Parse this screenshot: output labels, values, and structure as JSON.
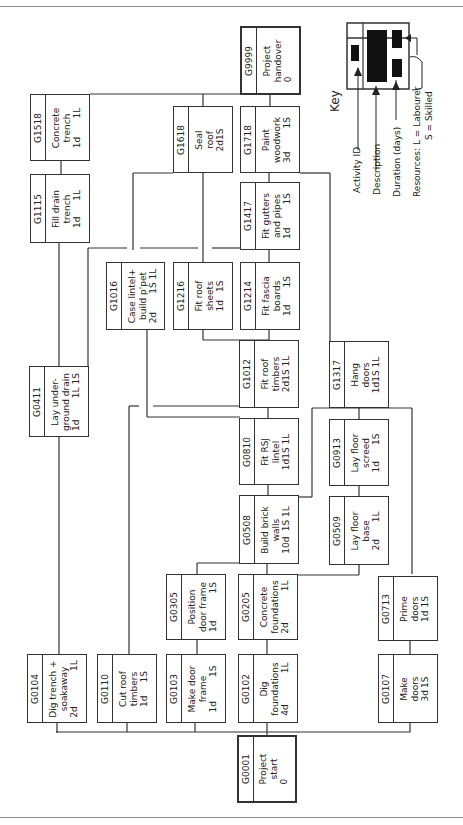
{
  "key": {
    "title": "Key",
    "labels": {
      "activity_id": "Activity ID",
      "description": "Description",
      "duration": "Duration (days)",
      "resources_label": "Resources:",
      "labourer": "L = Labourer",
      "skilled": "S = Skilled"
    }
  },
  "nodes": {
    "G0001": {
      "id": "G0001",
      "l1": "Project",
      "l2": "start",
      "dur": "0",
      "res": ""
    },
    "G0104": {
      "id": "G0104",
      "l1": "Dig trench +",
      "l2": "soakaway",
      "dur": "2d",
      "res": "1L"
    },
    "G0110": {
      "id": "G0110",
      "l1": "Cut roof",
      "l2": "timbers",
      "dur": "1d",
      "res": "1S"
    },
    "G0103": {
      "id": "G0103",
      "l1": "Make door",
      "l2": "frame",
      "dur": "1d",
      "res": "1S"
    },
    "G0102": {
      "id": "G0102",
      "l1": "Dig",
      "l2": "foundations",
      "dur": "4d",
      "res": "1L"
    },
    "G0107": {
      "id": "G0107",
      "l1": "Make",
      "l2": "doors",
      "dur": "3d",
      "res": "1S"
    },
    "G0305": {
      "id": "G0305",
      "l1": "Position",
      "l2": "door frame",
      "dur": "1d",
      "res": "1S"
    },
    "G0205": {
      "id": "G0205",
      "l1": "Concrete",
      "l2": "foundations",
      "dur": "2d",
      "res": "1L"
    },
    "G0713": {
      "id": "G0713",
      "l1": "Prime",
      "l2": "doors",
      "dur": "1d",
      "res": "1S"
    },
    "G0508": {
      "id": "G0508",
      "l1": "Build brick",
      "l2": "walls",
      "dur": "10d",
      "res": "1S 1L"
    },
    "G0509": {
      "id": "G0509",
      "l1": "Lay floor",
      "l2": "base",
      "dur": "2d",
      "res": "1L"
    },
    "G0810": {
      "id": "G0810",
      "l1": "Fit RSJ",
      "l2": "lintel",
      "dur": "1d",
      "res": "1S 1L"
    },
    "G0913": {
      "id": "G0913",
      "l1": "Lay floor",
      "l2": "screed",
      "dur": "1d",
      "res": "1S"
    },
    "G0411": {
      "id": "G0411",
      "l1": "Lay under-",
      "l2": "ground drain",
      "dur": "1d",
      "res": "1L 1S"
    },
    "G1012": {
      "id": "G1012",
      "l1": "Fit roof",
      "l2": "timbers",
      "dur": "2d",
      "res": "1S 1L"
    },
    "G1317": {
      "id": "G1317",
      "l1": "Hang",
      "l2": "doors",
      "dur": "1d",
      "res": "1S 1L"
    },
    "G1016": {
      "id": "G1016",
      "l1": "Case lintel+",
      "l2": "build p'pet",
      "dur": "2d",
      "res": "1S 1L"
    },
    "G1216": {
      "id": "G1216",
      "l1": "Fit roof",
      "l2": "sheets",
      "dur": "1d",
      "res": "1S"
    },
    "G1214": {
      "id": "G1214",
      "l1": "Fit fascia",
      "l2": "boards",
      "dur": "1d",
      "res": "1S"
    },
    "G1115": {
      "id": "G1115",
      "l1": "Fill drain",
      "l2": "trench",
      "dur": "1d",
      "res": "1L"
    },
    "G1417": {
      "id": "G1417",
      "l1": "Fit gutters",
      "l2": "and pipes",
      "dur": "1d",
      "res": "1S"
    },
    "G1518": {
      "id": "G1518",
      "l1": "Concrete",
      "l2": "trench",
      "dur": "1d",
      "res": "1L"
    },
    "G1618": {
      "id": "G1618",
      "l1": "Seal",
      "l2": "roof",
      "dur": "2d",
      "res": "1S"
    },
    "G1718": {
      "id": "G1718",
      "l1": "Paint",
      "l2": "woodwork",
      "dur": "3d",
      "res": "1S"
    },
    "G9999": {
      "id": "G9999",
      "l1": "Project",
      "l2": "handover",
      "dur": "0",
      "res": ""
    }
  }
}
